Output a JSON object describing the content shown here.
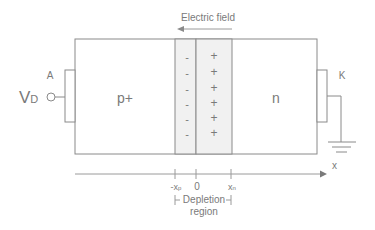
{
  "diagram": {
    "electric_field": {
      "label": "Electric field",
      "direction": "left"
    },
    "regions": {
      "p": {
        "label": "p+"
      },
      "n": {
        "label": "n"
      },
      "depletion_p_charges": [
        "-",
        "-",
        "-",
        "-",
        "-",
        "-"
      ],
      "depletion_n_charges": [
        "+",
        "+",
        "+",
        "+",
        "+",
        "+"
      ]
    },
    "terminals": {
      "anode": {
        "label": "A"
      },
      "cathode": {
        "label": "K"
      },
      "voltage": {
        "label_main": "V",
        "label_sub": "D"
      },
      "ground": "ground-symbol"
    },
    "axis": {
      "label": "x",
      "ticks": [
        {
          "label_main": "-x",
          "label_sub": "p"
        },
        {
          "label_main": "0",
          "label_sub": ""
        },
        {
          "label_main": "x",
          "label_sub": "n"
        }
      ]
    },
    "depletion_bracket": {
      "line1": "Depletion",
      "line2": "region"
    },
    "colors": {
      "line": "#8a8a8a",
      "text": "#7a7a7a",
      "depletion_fill": "#f1f1f1",
      "background": "#ffffff"
    }
  }
}
